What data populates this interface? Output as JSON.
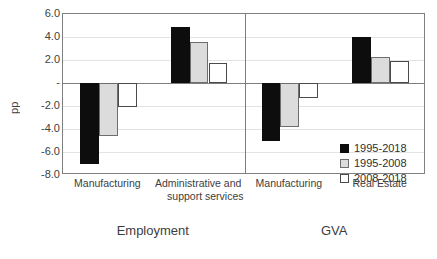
{
  "chart_data": {
    "type": "bar",
    "title": "",
    "xlabel": "",
    "ylabel": "pp",
    "ylim": [
      -8.0,
      6.0
    ],
    "ytick_step": 2.0,
    "grid": true,
    "legend_position": "inside bottom-right",
    "zero_tick_label": "-",
    "ytick_labels": [
      "6.0",
      "4.0",
      "2.0",
      "-",
      "-2.0",
      "-4.0",
      "-6.0",
      "-8.0"
    ],
    "ytick_values": [
      6.0,
      4.0,
      2.0,
      0.0,
      -2.0,
      -4.0,
      -6.0,
      -8.0
    ],
    "categories": [
      "Manufacturing",
      "Administrative and support services",
      "Manufacturing",
      "Real Estate"
    ],
    "category_lines": [
      [
        "Manufacturing"
      ],
      [
        "Administrative and",
        "support services"
      ],
      [
        "Manufacturing"
      ],
      [
        "Real Estate"
      ]
    ],
    "groups": [
      {
        "label": "Employment",
        "categories": [
          "Manufacturing",
          "Administrative and support services"
        ]
      },
      {
        "label": "GVA",
        "categories": [
          "Manufacturing",
          "Real Estate"
        ]
      }
    ],
    "series": [
      {
        "name": "1995-2018",
        "color": "#0d0d0d",
        "values": [
          -7.0,
          4.9,
          -5.0,
          4.0
        ]
      },
      {
        "name": "1995-2008",
        "color": "#dcdcdc",
        "values": [
          -4.6,
          3.6,
          -3.8,
          2.3
        ]
      },
      {
        "name": "2008-2018",
        "color": "#ffffff",
        "values": [
          -2.1,
          1.7,
          -1.3,
          1.9
        ]
      }
    ]
  },
  "legend": {
    "items": [
      {
        "label": "1995-2018"
      },
      {
        "label": "1995-2008"
      },
      {
        "label": "2008-2018"
      }
    ]
  },
  "axis": {
    "y_title": "pp"
  },
  "colors": {
    "series_1995_2018": "#0d0d0d",
    "series_1995_2008": "#dcdcdc",
    "series_2008_2018": "#ffffff",
    "axis": "#808080",
    "gridline": "#e3e3e3",
    "text": "#3d3d3d"
  }
}
